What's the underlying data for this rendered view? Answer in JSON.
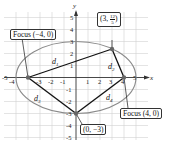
{
  "figure": {
    "axes": {
      "x_label": "x",
      "y_label": "y",
      "x_ticks": [
        "-5",
        "-4",
        "-3",
        "-2",
        "-1",
        "1",
        "2",
        "3",
        "4",
        "5"
      ],
      "y_ticks": [
        "5",
        "4",
        "3",
        "2",
        "1",
        "-1",
        "-2",
        "-3",
        "-4",
        "-5"
      ]
    },
    "ellipse": {
      "a": 5,
      "b": 3,
      "center": [
        0,
        0
      ]
    },
    "points": {
      "focus_left": {
        "label": "Focus (−4, 0)",
        "x": -4,
        "y": 0
      },
      "focus_right": {
        "label": "Focus (4, 0)",
        "x": 4,
        "y": 0
      },
      "upper_point": {
        "label_prefix": "(3, ",
        "num": "12",
        "den": "5",
        "label_suffix": ")",
        "x": 3,
        "y": 2.4
      },
      "lower_point": {
        "label": "(0, −3)",
        "x": 0,
        "y": -3
      }
    },
    "distances": {
      "d1": {
        "base": "d",
        "sub": "1"
      },
      "d2": {
        "base": "d",
        "sub": "2"
      },
      "d3": {
        "base": "d",
        "sub": "3"
      },
      "d4": {
        "base": "d",
        "sub": "4"
      }
    },
    "colors": {
      "grid": "#cfcfcf",
      "axis": "#333333",
      "ellipse": "#8a8a8a",
      "segment": "#111111",
      "point": "#666666"
    }
  }
}
